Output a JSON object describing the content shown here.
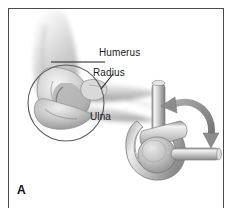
{
  "figure": {
    "panel_letter": "A",
    "background_color": "#ffffff",
    "frame_color": "#4a4a4a",
    "ink_color": "#1b1b1b",
    "style": "grayscale airbrush medical illustration"
  },
  "anatomy": {
    "caption_labels": [
      {
        "id": "humerus",
        "text": "Humerus",
        "leader": "horizontal"
      },
      {
        "id": "radius",
        "text": "Radius",
        "leader": "diagonal"
      },
      {
        "id": "ulna",
        "text": "Ulna",
        "leader": "none"
      }
    ],
    "highlight": {
      "shape": "circle",
      "target": "elbow joint (trochlea and olecranon)",
      "stroke_color": "#555555"
    },
    "structures": [
      "upper arm soft tissue",
      "distal humerus",
      "olecranon of ulna",
      "radial head",
      "forearm soft tissue"
    ]
  },
  "mechanical_analogy": {
    "name": "hinge joint model",
    "parts": [
      {
        "id": "upright-pin",
        "label": "upright pin"
      },
      {
        "id": "clevis-yoke",
        "label": "clevis yoke"
      },
      {
        "id": "hinge-barrel",
        "label": "hinge barrel"
      },
      {
        "id": "lever-arm",
        "label": "lever arm"
      }
    ],
    "motion_arrow": {
      "type": "curved",
      "direction": "bidirectional",
      "meaning": "flexion and extension rotation",
      "color": "#8d8d8d"
    }
  },
  "palette": {
    "tone_lightest": "#f2f2f2",
    "tone_light": "#dcdcdc",
    "tone_mid": "#b8b8b8",
    "tone_dark": "#8e8e8e",
    "tone_darkest": "#5f5f5f",
    "outline": "#6b6b6b"
  }
}
